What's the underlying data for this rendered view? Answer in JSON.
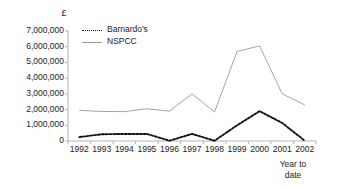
{
  "chart_data": {
    "type": "line",
    "title": "",
    "xlabel": "",
    "ylabel": "£",
    "axis_note": [
      "Year to",
      "date"
    ],
    "categories": [
      "1992",
      "1993",
      "1994",
      "1995",
      "1996",
      "1997",
      "1998",
      "1999",
      "2000",
      "2001",
      "2002"
    ],
    "ylim": [
      0,
      7000000
    ],
    "ytick_values": [
      7000000,
      6000000,
      5000000,
      4000000,
      3000000,
      2000000,
      1000000,
      0
    ],
    "ytick_labels": [
      "7,000,000",
      "6,000,000",
      "5,000,000",
      "4,000,000",
      "3,000,000",
      "2,000,000",
      "1,000,000",
      "0"
    ],
    "grid": false,
    "legend_position": "inside-top-left",
    "series": [
      {
        "name": "Barnardo's",
        "style": "dashed",
        "color": "#111111",
        "values": [
          250000,
          430000,
          450000,
          450000,
          20000,
          450000,
          20000,
          1000000,
          1900000,
          1150000,
          20000
        ]
      },
      {
        "name": "NSPCC",
        "style": "solid",
        "color": "#9a9a9a",
        "values": [
          1950000,
          1880000,
          1870000,
          2050000,
          1900000,
          3000000,
          1850000,
          5700000,
          6050000,
          3000000,
          2300000
        ]
      }
    ]
  },
  "legend": {
    "items": [
      {
        "label": "Barnardo's"
      },
      {
        "label": "NSPCC"
      }
    ]
  },
  "axis": {
    "currency_symbol": "£",
    "note_line1": "Year to",
    "note_line2": "date"
  }
}
